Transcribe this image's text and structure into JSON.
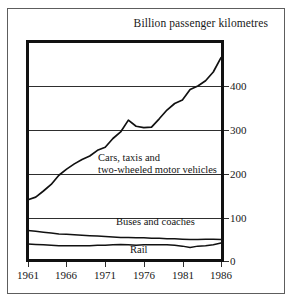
{
  "chart_data": {
    "type": "line",
    "title": "Billion passenger kilometres",
    "xlabel": "",
    "ylabel": "Billion passenger kilometres",
    "xlim": [
      1961,
      1986
    ],
    "ylim": [
      0,
      500
    ],
    "yticks": [
      0,
      100,
      200,
      300,
      400
    ],
    "xticks": [
      1961,
      1966,
      1971,
      1976,
      1981,
      1986
    ],
    "grid": true,
    "legend_position": "inline-annotations",
    "x": [
      1961,
      1962,
      1963,
      1964,
      1965,
      1966,
      1967,
      1968,
      1969,
      1970,
      1971,
      1972,
      1973,
      1974,
      1975,
      1976,
      1977,
      1978,
      1979,
      1980,
      1981,
      1982,
      1983,
      1984,
      1985,
      1986
    ],
    "series": [
      {
        "name": "Cars, taxis and two-wheeled motor vehicles",
        "label_line1": "Cars, taxis and",
        "label_line2": "two-wheeled motor vehicles",
        "values": [
          140,
          146,
          160,
          175,
          196,
          210,
          222,
          232,
          240,
          253,
          260,
          280,
          295,
          322,
          308,
          305,
          306,
          325,
          345,
          360,
          368,
          392,
          400,
          412,
          432,
          465
        ]
      },
      {
        "name": "Buses and coaches",
        "label_line1": "Buses and coaches",
        "values": [
          70,
          68,
          66,
          64,
          62,
          61,
          60,
          59,
          58,
          57,
          56,
          55,
          54,
          54,
          53,
          53,
          52,
          52,
          51,
          51,
          50,
          49,
          49,
          50,
          50,
          49
        ]
      },
      {
        "name": "Rail",
        "label_line1": "Rail",
        "values": [
          39,
          38,
          37,
          36,
          35,
          35,
          35,
          35,
          35,
          36,
          36,
          37,
          38,
          37,
          36,
          37,
          37,
          37,
          37,
          36,
          34,
          31,
          34,
          35,
          37,
          41
        ]
      }
    ]
  },
  "ytick_labels": [
    "400",
    "300",
    "200",
    "100",
    "0"
  ],
  "xtick_labels": [
    "1961",
    "1966",
    "1971",
    "1976",
    "1981",
    "1986"
  ],
  "labels": {
    "cars_line1": "Cars, taxis and",
    "cars_line2": "two-wheeled motor vehicles",
    "buses": "Buses and coaches",
    "rail": "Rail"
  },
  "colors": {
    "line": "#111111",
    "grid": "#2e2e2e",
    "frame": "#111111",
    "text": "#181818",
    "background": "#ffffff"
  }
}
